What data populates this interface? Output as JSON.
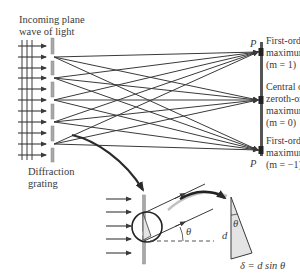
{
  "labels": {
    "incoming": "Incoming plane\nwave of light",
    "grating": "Diffraction\ngrating",
    "first_order_top": "First-order\nmaximum\n(m = 1)",
    "central": "Central or\nzeroth-order\nmaximum\n(m = 0)",
    "first_order_bottom": "First-order\nmaximum\n(m = −1)",
    "p_top": "P",
    "p_bottom": "P",
    "theta_detail": "θ",
    "theta_triangle": "θ",
    "d_label": "d",
    "path_difference": "δ = d sin θ"
  },
  "colors": {
    "line": "#3a3a3a",
    "grating": "#a8a8a8",
    "screen": "#555555",
    "triangle_fill": "#e4e4e4",
    "arrow_gray": "#999999"
  }
}
